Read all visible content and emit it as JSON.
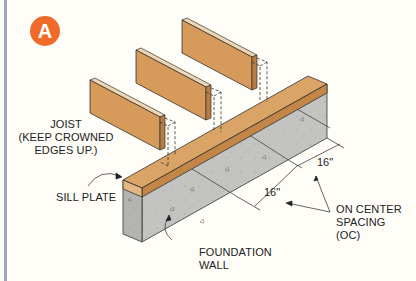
{
  "figure": {
    "badge": "A",
    "colors": {
      "badge": "#ef6b2a",
      "wood_face": "#d69a5a",
      "wood_top": "#edd3b2",
      "wood_side": "#c1844a",
      "concrete_front": "#b9b9b7",
      "concrete_side": "#c6c6c4",
      "border": "#9aa8b8"
    }
  },
  "labels": {
    "joist_line1": "JOIST",
    "joist_line2": "(KEEP CROWNED",
    "joist_line3": "EDGES UP.)",
    "sill_plate": "SILL PLATE",
    "foundation_line1": "FOUNDATION",
    "foundation_line2": "WALL",
    "oc_line1": "ON CENTER",
    "oc_line2": "SPACING",
    "oc_line3": "(OC)"
  },
  "dimensions": {
    "upper": "16\"",
    "lower": "16\""
  }
}
